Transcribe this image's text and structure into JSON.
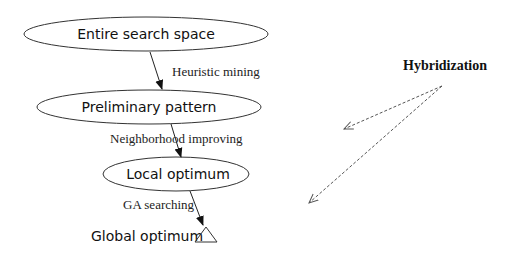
{
  "diagram": {
    "nodes": [
      {
        "id": "entire",
        "label": "Entire search space",
        "shape": "ellipse"
      },
      {
        "id": "preliminary",
        "label": "Preliminary pattern",
        "shape": "ellipse"
      },
      {
        "id": "local",
        "label": "Local optimum",
        "shape": "ellipse"
      },
      {
        "id": "global",
        "label": "Global optimum",
        "shape": "triangle"
      }
    ],
    "edges": [
      {
        "from": "entire",
        "to": "preliminary",
        "label": "Heuristic mining"
      },
      {
        "from": "preliminary",
        "to": "local",
        "label": "Neighborhood improving"
      },
      {
        "from": "local",
        "to": "global",
        "label": "GA searching"
      }
    ],
    "hybridization": {
      "label": "Hybridization",
      "arrows": [
        "dashed-arrow-to-neighborhood-improving",
        "dashed-arrow-to-ga-searching"
      ]
    }
  },
  "colors": {
    "stroke": "#222222",
    "dashed": "#555555",
    "background": "#ffffff"
  }
}
